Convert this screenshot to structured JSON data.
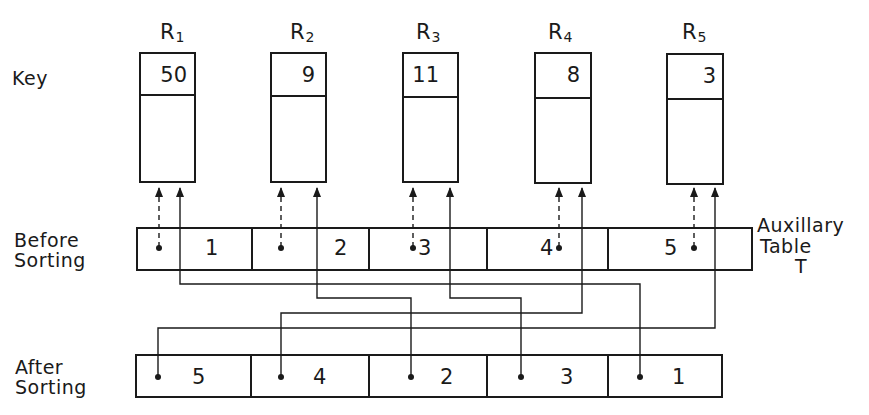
{
  "labels": {
    "key": "Key",
    "before_line1": "Before",
    "before_line2": "Sorting",
    "after_line1": "After",
    "after_line2": "Sorting",
    "aux_line1": "Auxillary",
    "aux_line2": "Table",
    "aux_line3": "T"
  },
  "records": [
    {
      "name": "R",
      "sub": "1",
      "key": "50"
    },
    {
      "name": "R",
      "sub": "2",
      "key": "9"
    },
    {
      "name": "R",
      "sub": "3",
      "key": "11"
    },
    {
      "name": "R",
      "sub": "4",
      "key": "8"
    },
    {
      "name": "R",
      "sub": "5",
      "key": "3"
    }
  ],
  "before_sorting": [
    "1",
    "2",
    "3",
    "4",
    "5"
  ],
  "after_sorting": [
    "5",
    "4",
    "2",
    "3",
    "1"
  ],
  "colors": {
    "ink": "#1a1a1a",
    "background": "#ffffff"
  }
}
